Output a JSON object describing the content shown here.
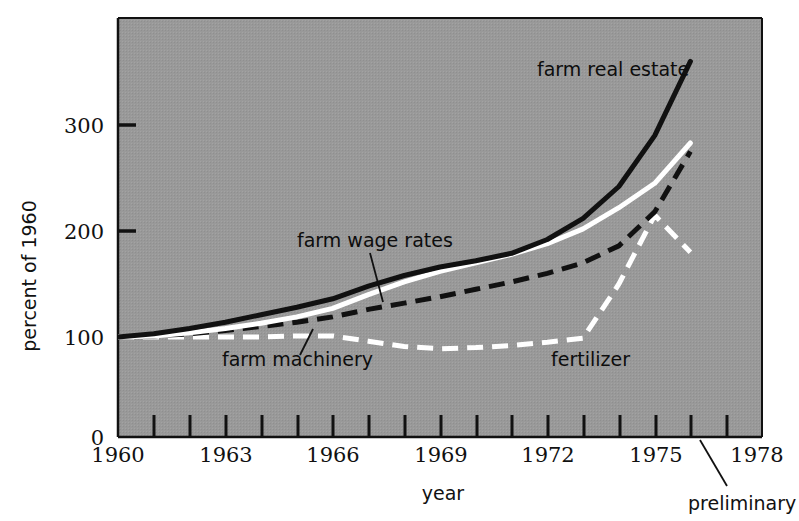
{
  "chart_data": {
    "type": "line",
    "title": "",
    "xlabel": "year",
    "ylabel": "percent of 1960",
    "xlim": [
      1960,
      1978
    ],
    "ylim": [
      0,
      380
    ],
    "yticks": [
      0,
      100,
      200,
      300
    ],
    "ytick_labels": [
      "0",
      "100",
      "200",
      "300"
    ],
    "xticks": [
      1960,
      1961,
      1962,
      1963,
      1964,
      1965,
      1966,
      1967,
      1968,
      1969,
      1970,
      1971,
      1972,
      1973,
      1974,
      1975,
      1976,
      1977,
      1978
    ],
    "xtick_labels_shown": [
      "1960",
      "1963",
      "1966",
      "1969",
      "1972",
      "1975",
      "1978"
    ],
    "xtick_labels_shown_values": [
      1960,
      1963,
      1966,
      1969,
      1972,
      1975,
      1978
    ],
    "grid": false,
    "legend_position": "inline-annotations",
    "background_color": "#999999",
    "x": [
      1960,
      1961,
      1962,
      1963,
      1964,
      1965,
      1966,
      1967,
      1968,
      1969,
      1970,
      1971,
      1972,
      1973,
      1974,
      1975,
      1976
    ],
    "series": [
      {
        "name": "farm real estate",
        "color": "#111111",
        "style": "solid",
        "values": [
          100,
          103,
          108,
          114,
          121,
          128,
          136,
          148,
          158,
          166,
          172,
          179,
          192,
          212,
          242,
          290,
          360
        ]
      },
      {
        "name": "farm wage rates",
        "color": "#ffffff",
        "style": "solid",
        "values": [
          100,
          101,
          104,
          108,
          113,
          119,
          127,
          140,
          152,
          162,
          170,
          178,
          188,
          202,
          222,
          245,
          283
        ]
      },
      {
        "name": "farm machinery",
        "color": "#111111",
        "style": "dashed",
        "values": [
          100,
          101,
          103,
          106,
          110,
          114,
          119,
          126,
          132,
          138,
          145,
          152,
          160,
          170,
          186,
          218,
          275
        ]
      },
      {
        "name": "fertilizer",
        "color": "#ffffff",
        "style": "dashed",
        "values": [
          100,
          100,
          100,
          100,
          100,
          101,
          101,
          96,
          91,
          89,
          90,
          92,
          95,
          99,
          150,
          215,
          180
        ]
      }
    ],
    "annotations": [
      {
        "text": "farm real estate",
        "x": 1973.0,
        "y": 335
      },
      {
        "text": "farm wage rates",
        "x": 1965.2,
        "y": 202
      },
      {
        "text": "farm machinery",
        "x": 1962.4,
        "y": 68
      },
      {
        "text": "fertilizer",
        "x": 1970.9,
        "y": 68
      },
      {
        "text": "preliminary",
        "x": 1976.4,
        "y": -60
      }
    ]
  },
  "axes": {
    "y_axis_title": "percent of 1960",
    "x_axis_title": "year",
    "y_labels": [
      "300",
      "200",
      "100",
      "0"
    ],
    "x_labels": [
      "1960",
      "1963",
      "1966",
      "1969",
      "1972",
      "1975",
      "1978"
    ]
  },
  "labels": {
    "farm_real_estate": "farm real estate",
    "farm_wage_rates": "farm wage rates",
    "farm_machinery": "farm machinery",
    "fertilizer": "fertilizer",
    "preliminary": "preliminary"
  }
}
